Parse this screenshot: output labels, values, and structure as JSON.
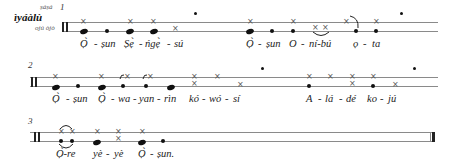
{
  "header": {
    "instrument": "ìyáàlù",
    "upper_label": "ṣáṣá",
    "lower_label": "ojú òjò"
  },
  "systems": [
    {
      "number": "1",
      "syllables": [
        "Ọ̀",
        "-",
        "ṣun",
        "Ṣẹ̀",
        "-",
        "ńgẹ̀",
        "-",
        "sú",
        "Ọ̀",
        "-",
        "ṣun",
        "O",
        "-",
        "ní-bú",
        "ọ",
        "-",
        "ta"
      ]
    },
    {
      "number": "2",
      "syllables": [
        "Ọ̀",
        "-",
        "ṣun",
        "Ọ̀",
        "-",
        "wa",
        "-",
        "yan",
        "-",
        "rìn",
        "kó",
        "-",
        "wó",
        "-",
        "sí",
        "A",
        "-",
        "lá",
        "-",
        "dé",
        "ko",
        "-",
        "jú"
      ]
    },
    {
      "number": "3",
      "syllables": [
        "Ọ̀-re",
        "yè",
        "-",
        "yè",
        "Ọ̀",
        "-",
        "ṣun."
      ]
    }
  ]
}
